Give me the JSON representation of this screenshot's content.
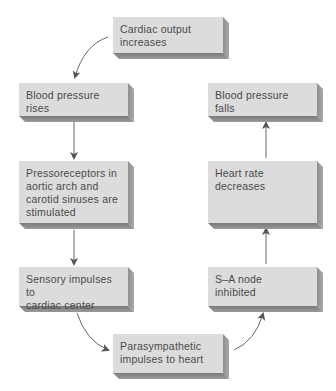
{
  "diagram": {
    "nodes": [
      {
        "id": "cardiac-output",
        "label": "Cardiac output\nincreases"
      },
      {
        "id": "bp-rises",
        "label": "Blood pressure\nrises"
      },
      {
        "id": "pressoreceptors",
        "label": "Pressoreceptors in\naortic arch and\ncarotid sinuses are\nstimulated"
      },
      {
        "id": "sensory",
        "label": "Sensory impulses to\ncardiac center"
      },
      {
        "id": "parasympathetic",
        "label": "Parasympathetic\nimpulses to heart"
      },
      {
        "id": "sa-node",
        "label": "S–A node\ninhibited"
      },
      {
        "id": "heart-rate",
        "label": "Heart rate\ndecreases"
      },
      {
        "id": "bp-falls",
        "label": "Blood pressure\nfalls"
      }
    ],
    "edges": [
      {
        "from": "cardiac-output",
        "to": "bp-rises"
      },
      {
        "from": "bp-rises",
        "to": "pressoreceptors"
      },
      {
        "from": "pressoreceptors",
        "to": "sensory"
      },
      {
        "from": "sensory",
        "to": "parasympathetic"
      },
      {
        "from": "parasympathetic",
        "to": "sa-node"
      },
      {
        "from": "sa-node",
        "to": "heart-rate"
      },
      {
        "from": "heart-rate",
        "to": "bp-falls"
      }
    ],
    "colors": {
      "box_face": "#dcdcdc",
      "box_shadow": "#8a8a8a",
      "text": "#4a4a4a",
      "arrow": "#555555"
    }
  }
}
